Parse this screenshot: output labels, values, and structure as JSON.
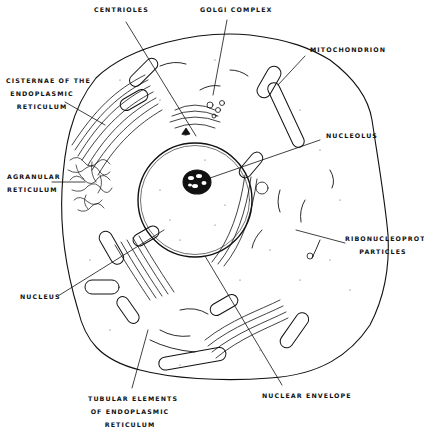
{
  "figure": {
    "type": "line drawing",
    "colors": {
      "ink": "#111111",
      "background": "#ffffff",
      "stipple": "#555555"
    }
  },
  "labels": {
    "centrioles": "Centrioles",
    "golgi": "Golgi Complex",
    "mitochondrion": "Mitochondrion",
    "cisternae": [
      "Cisternae of the",
      "Endoplasmic",
      "Reticulum"
    ],
    "nucleolus": "Nucleolus",
    "agranular": [
      "Agranular",
      "Reticulum"
    ],
    "ribonucleoprotein": [
      "Ribonucleoprotein",
      "Particles"
    ],
    "nucleus": "Nucleus",
    "tubular": [
      "Tubular Elements",
      "of Endoplasmic",
      "Reticulum"
    ],
    "nuclear_envelope": "Nuclear Envelope"
  }
}
